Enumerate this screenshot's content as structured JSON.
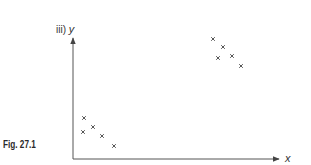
{
  "figure": {
    "caption": "Fig. 27.1",
    "part_label": "iii)",
    "y_axis_label": "y",
    "x_axis_label": "x",
    "marker": "×",
    "colors": {
      "axis": "#444444",
      "marker": "#555555",
      "text": "#333333"
    }
  },
  "chart_data": {
    "type": "scatter",
    "title": "",
    "xlabel": "x",
    "ylabel": "y",
    "grid": false,
    "legend": null,
    "annotations": [
      "iii)",
      "Fig. 27.1"
    ],
    "series": [
      {
        "name": "low cluster",
        "points": [
          [
            84,
            118
          ],
          [
            93,
            127
          ],
          [
            83,
            132
          ],
          [
            102,
            136
          ],
          [
            114,
            146
          ]
        ]
      },
      {
        "name": "high cluster",
        "points": [
          [
            213,
            39
          ],
          [
            223,
            47
          ],
          [
            218,
            58
          ],
          [
            232,
            56
          ],
          [
            241,
            66
          ]
        ]
      }
    ],
    "axis_origin_px": [
      73,
      159
    ],
    "axis_ends_px": {
      "x": [
        278,
        159
      ],
      "y": [
        73,
        37
      ]
    }
  }
}
